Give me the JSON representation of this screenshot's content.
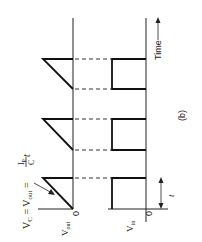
{
  "figure": {
    "label": "(b)",
    "time_label": "Time",
    "period_label": "t",
    "vout_axis": {
      "label": "V",
      "sub": "out",
      "zero": "0"
    },
    "vin_axis": {
      "label": "V",
      "sub": "in",
      "zero": "0"
    },
    "equation": {
      "lhs": "V",
      "lhs_sub": "C",
      "eq1": " = ",
      "mid": "V",
      "mid_sub": "out",
      "eq2": " = ",
      "num": "I",
      "num_sub": "P",
      "den": "C",
      "tail": " t"
    },
    "colors": {
      "line": "#111111",
      "background": "#ffffff"
    }
  }
}
